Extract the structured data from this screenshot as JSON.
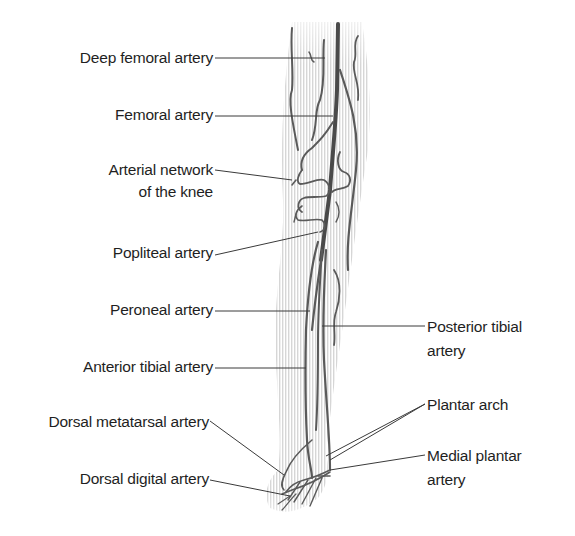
{
  "diagram": {
    "colors": {
      "artery": "#5a5a5a",
      "leader_line": "#3a3a3a",
      "leg_shading": "#d6d6d6",
      "text": "#1f1f1f",
      "background": "#ffffff"
    },
    "labels_left": [
      {
        "id": "deep-femoral",
        "text": "Deep femoral artery"
      },
      {
        "id": "femoral",
        "text": "Femoral artery"
      },
      {
        "id": "arterial-network-1",
        "text": "Arterial network"
      },
      {
        "id": "arterial-network-2",
        "text": "of the knee"
      },
      {
        "id": "popliteal",
        "text": "Popliteal artery"
      },
      {
        "id": "peroneal",
        "text": "Peroneal artery"
      },
      {
        "id": "anterior-tibial",
        "text": "Anterior tibial artery"
      },
      {
        "id": "dorsal-metatarsal",
        "text": "Dorsal metatarsal artery"
      },
      {
        "id": "dorsal-digital",
        "text": "Dorsal digital artery"
      }
    ],
    "labels_right": [
      {
        "id": "posterior-tibial-1",
        "text": "Posterior tibial"
      },
      {
        "id": "posterior-tibial-2",
        "text": "artery"
      },
      {
        "id": "plantar-arch",
        "text": "Plantar arch"
      },
      {
        "id": "medial-plantar-1",
        "text": "Medial plantar"
      },
      {
        "id": "medial-plantar-2",
        "text": "artery"
      }
    ]
  }
}
